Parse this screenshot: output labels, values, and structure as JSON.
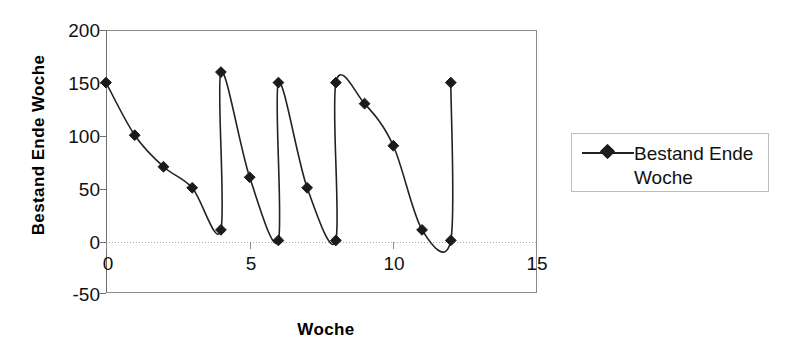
{
  "chart_data": {
    "type": "line",
    "title": "",
    "xlabel": "Woche",
    "ylabel": "Bestand Ende Woche",
    "xlim": [
      0,
      15
    ],
    "ylim": [
      -50,
      200
    ],
    "xticks": [
      "0",
      "5",
      "10",
      "15"
    ],
    "xtick_values": [
      0,
      5,
      10,
      15
    ],
    "yticks": [
      "-50",
      "0",
      "50",
      "100",
      "150",
      "200"
    ],
    "ytick_values": [
      -50,
      0,
      50,
      100,
      150,
      200
    ],
    "grid": "horizontal-zero-dotted",
    "legend_position": "right",
    "marker": "diamond",
    "line_color": "#222222",
    "marker_color": "#1b1b1b",
    "series": [
      {
        "name": "Bestand Ende Woche",
        "x": [
          0,
          1,
          2,
          3,
          4,
          4,
          5,
          6,
          6,
          7,
          8,
          8,
          9,
          10,
          11,
          12,
          12
        ],
        "values": [
          150,
          100,
          70,
          50,
          10,
          160,
          60,
          0,
          150,
          50,
          0,
          150,
          130,
          90,
          10,
          0,
          150
        ]
      }
    ]
  },
  "legend": {
    "entries": [
      {
        "label_line1": "Bestand Ende",
        "label_line2": "Woche",
        "marker": "diamond-marker"
      }
    ]
  },
  "axes": {
    "x_title": "Woche",
    "y_title": "Bestand Ende Woche"
  }
}
